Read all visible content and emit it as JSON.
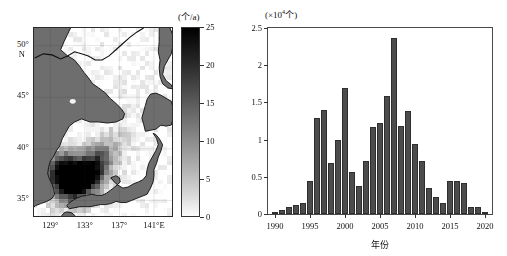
{
  "figure": {
    "panels": [
      "map-panel",
      "bar-panel"
    ]
  },
  "map": {
    "colorbar_title": "(个/a)",
    "colorbar_unit_note": "counts per year",
    "colorbar_ticks": [
      0,
      5,
      10,
      15,
      20,
      25
    ],
    "colorbar_min": 0,
    "colorbar_max": 25,
    "colorbar_low_color": "#ffffff",
    "colorbar_high_color": "#000000",
    "lat_labels": [
      "50°",
      "N",
      "45°",
      "40°",
      "35°"
    ],
    "lat_values": [
      50,
      45,
      40,
      35
    ],
    "lat_hemisphere": "N",
    "lon_labels": [
      "129°",
      "133°",
      "137°",
      "141°E"
    ],
    "lon_values": [
      129,
      133,
      137,
      141
    ],
    "lon_hemisphere": "E",
    "land_color": "#6e6e6e",
    "region_description": "Sea of Japan"
  },
  "chart_data": {
    "type": "bar",
    "title_base": "(×10",
    "title_exp": "4",
    "title_tail": "个)",
    "xlabel": "年份",
    "ylabel": "",
    "ylim": [
      0,
      2.5
    ],
    "xlim": [
      1989,
      2021
    ],
    "yticks": [
      0,
      0.5,
      1,
      1.5,
      2,
      2.5
    ],
    "ytick_labels": [
      "0",
      "0.5",
      "1",
      "1.5",
      "2",
      "2.5"
    ],
    "xticks": [
      1990,
      1995,
      2000,
      2005,
      2010,
      2015,
      2020
    ],
    "xtick_labels": [
      "1990",
      "1995",
      "2000",
      "2005",
      "2010",
      "2015",
      "2020"
    ],
    "grid": false,
    "legend": null,
    "bar_color": "#4c4c4c",
    "categories": [
      1990,
      1991,
      1992,
      1993,
      1994,
      1995,
      1996,
      1997,
      1998,
      1999,
      2000,
      2001,
      2002,
      2003,
      2004,
      2005,
      2006,
      2007,
      2008,
      2009,
      2010,
      2011,
      2012,
      2013,
      2014,
      2015,
      2016,
      2017,
      2018,
      2019,
      2020
    ],
    "values": [
      0.01,
      0.05,
      0.1,
      0.12,
      0.15,
      0.45,
      1.29,
      1.4,
      0.68,
      1.0,
      1.7,
      0.56,
      0.37,
      0.71,
      1.17,
      1.23,
      1.59,
      2.36,
      1.18,
      1.38,
      0.94,
      0.71,
      0.35,
      0.23,
      0.15,
      0.45,
      0.45,
      0.42,
      0.09,
      0.09,
      0.02
    ]
  }
}
